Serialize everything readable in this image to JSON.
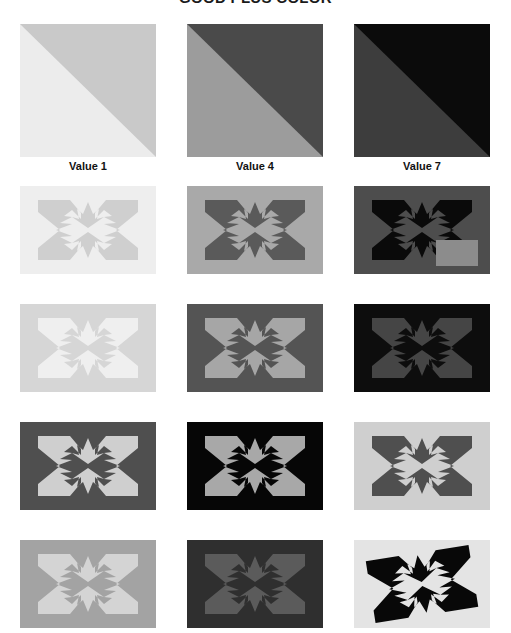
{
  "title": "GOOD PLUS COLOR",
  "columns": [
    {
      "label": "Value 1",
      "x": 20
    },
    {
      "label": "Value 4",
      "x": 187
    },
    {
      "label": "Value 7",
      "x": 354
    }
  ],
  "swatches": [
    {
      "name": "swatch-value-1",
      "upper": "#c9c9c9",
      "lower": "#ececec",
      "x": 20
    },
    {
      "name": "swatch-value-4",
      "upper": "#4a4a4a",
      "lower": "#9c9c9c",
      "x": 187
    },
    {
      "name": "swatch-value-7",
      "upper": "#0b0b0b",
      "lower": "#3d3d3d",
      "x": 354
    }
  ],
  "rows": [
    {
      "name": "pattern-row-1",
      "y": 0,
      "tiles": [
        {
          "name": "pattern-tile-r1c1",
          "x": 20,
          "bg": "#eeeeee",
          "fg": "#cfcfcf",
          "variant": "standard",
          "patch": null
        },
        {
          "name": "pattern-tile-r1c2",
          "x": 187,
          "bg": "#a9a9a9",
          "fg": "#5a5a5a",
          "variant": "standard",
          "patch": null
        },
        {
          "name": "pattern-tile-r1c3",
          "x": 354,
          "bg": "#4d4d4d",
          "fg": "#0a0a0a",
          "variant": "standard",
          "patch": {
            "name": "anomaly-patch",
            "color": "#8c8c8c",
            "x": 82,
            "y": 54,
            "w": 42,
            "h": 26
          }
        }
      ]
    },
    {
      "name": "pattern-row-2",
      "y": 118,
      "tiles": [
        {
          "name": "pattern-tile-r2c1",
          "x": 20,
          "bg": "#d6d6d6",
          "fg": "#efefef",
          "variant": "standard",
          "patch": null
        },
        {
          "name": "pattern-tile-r2c2",
          "x": 187,
          "bg": "#545454",
          "fg": "#a6a6a6",
          "variant": "standard",
          "patch": null
        },
        {
          "name": "pattern-tile-r2c3",
          "x": 354,
          "bg": "#0d0d0d",
          "fg": "#454545",
          "variant": "standard",
          "patch": null
        }
      ]
    },
    {
      "name": "pattern-row-3",
      "y": 236,
      "tiles": [
        {
          "name": "pattern-tile-r3c1",
          "x": 20,
          "bg": "#4f4f4f",
          "fg": "#cfcfcf",
          "variant": "standard",
          "patch": null
        },
        {
          "name": "pattern-tile-r3c2",
          "x": 187,
          "bg": "#060606",
          "fg": "#a8a8a8",
          "variant": "standard",
          "patch": null
        },
        {
          "name": "pattern-tile-r3c3",
          "x": 354,
          "bg": "#cfcfcf",
          "fg": "#4f4f4f",
          "variant": "standard",
          "patch": null
        }
      ]
    },
    {
      "name": "pattern-row-4",
      "y": 354,
      "tiles": [
        {
          "name": "pattern-tile-r4c1",
          "x": 20,
          "bg": "#a3a3a3",
          "fg": "#d4d4d4",
          "variant": "standard",
          "patch": null
        },
        {
          "name": "pattern-tile-r4c2",
          "x": 187,
          "bg": "#2f2f2f",
          "fg": "#5b5b5b",
          "variant": "standard",
          "patch": null
        },
        {
          "name": "pattern-tile-r4c3",
          "x": 354,
          "bg": "#e4e4e4",
          "fg": "#080808",
          "variant": "rotated",
          "patch": null
        }
      ]
    }
  ]
}
